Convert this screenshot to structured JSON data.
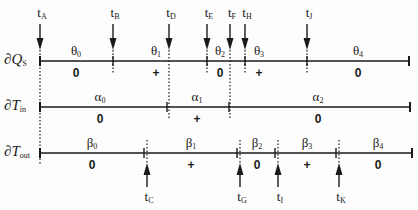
{
  "rows": [
    {
      "id": "Qs",
      "label_prefix": "∂",
      "label_var": "Q",
      "label_sub": "S",
      "y": 61,
      "start": 40,
      "end": 409,
      "ticks": [
        40,
        113,
        207,
        245,
        307,
        409
      ],
      "segments": [
        {
          "greek": "θ",
          "sub": "0",
          "x": 76,
          "sign": "0"
        },
        {
          "greek": "θ",
          "sub": "1",
          "x": 156,
          "sign": "+"
        },
        {
          "greek": "θ",
          "sub": "2",
          "x": 220,
          "sign": "0"
        },
        {
          "greek": "θ",
          "sub": "3",
          "x": 259,
          "sign": "+"
        },
        {
          "greek": "θ",
          "sub": "4",
          "x": 358,
          "sign": "0"
        }
      ]
    },
    {
      "id": "Tin",
      "label_prefix": "∂",
      "label_var": "T",
      "label_sub": "in",
      "y": 107,
      "start": 40,
      "end": 410,
      "ticks": [
        40,
        167,
        229,
        410
      ],
      "segments": [
        {
          "greek": "α",
          "sub": "0",
          "x": 100,
          "sign": "0"
        },
        {
          "greek": "α",
          "sub": "1",
          "x": 197,
          "sign": "+"
        },
        {
          "greek": "α",
          "sub": "2",
          "x": 318,
          "sign": "0"
        }
      ]
    },
    {
      "id": "Tout",
      "label_prefix": "∂",
      "label_var": "T",
      "label_sub": "out",
      "y": 153,
      "start": 40,
      "end": 412,
      "ticks": [
        40,
        144,
        237,
        275,
        336,
        412
      ],
      "segments": [
        {
          "greek": "β",
          "sub": "0",
          "x": 92,
          "sign": "0"
        },
        {
          "greek": "β",
          "sub": "1",
          "x": 191,
          "sign": "+"
        },
        {
          "greek": "β",
          "sub": "2",
          "x": 257,
          "sign": "0"
        },
        {
          "greek": "β",
          "sub": "3",
          "x": 307,
          "sign": "+"
        },
        {
          "greek": "β",
          "sub": "4",
          "x": 378,
          "sign": "0"
        }
      ]
    }
  ],
  "top_events": [
    {
      "name": "A",
      "x": 40,
      "dotted_to": 165
    },
    {
      "name": "B",
      "x": 113,
      "dotted_to": 74
    },
    {
      "name": "D",
      "x": 169,
      "dotted_to": 118
    },
    {
      "name": "E",
      "x": 207,
      "dotted_to": 74
    },
    {
      "name": "F",
      "x": 230,
      "dotted_to": 118
    },
    {
      "name": "H",
      "x": 245,
      "dotted_to": 74
    },
    {
      "name": "J",
      "x": 307,
      "dotted_to": 74
    }
  ],
  "bottom_events": [
    {
      "name": "C",
      "x": 147,
      "dotted_from": 140
    },
    {
      "name": "G",
      "x": 240,
      "dotted_from": 140
    },
    {
      "name": "I",
      "x": 278,
      "dotted_from": 140
    },
    {
      "name": "K",
      "x": 339,
      "dotted_from": 140
    }
  ],
  "colors": {
    "ink": "#1a1a1a",
    "background": "#fdfdfd"
  }
}
